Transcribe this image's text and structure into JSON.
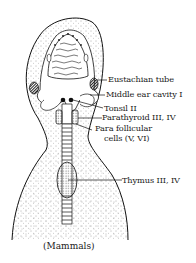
{
  "diagram": {
    "type": "anatomical-illustration",
    "caption": "(Mammals)",
    "labels": [
      {
        "id": "eustachian-tube",
        "text": "Eustachian tube"
      },
      {
        "id": "middle-ear-cavity",
        "text": "Middle ear cavity I"
      },
      {
        "id": "tonsil",
        "text": "Tonsil II"
      },
      {
        "id": "parathyroid",
        "text": "Parathyroid III, IV"
      },
      {
        "id": "para-follicular-line1",
        "text": "Para follicular"
      },
      {
        "id": "para-follicular-line2",
        "text": "cells (V, VI)"
      },
      {
        "id": "thymus",
        "text": "Thymus III, IV"
      }
    ]
  }
}
